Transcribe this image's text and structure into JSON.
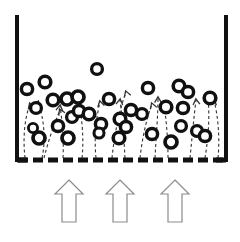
{
  "figure": {
    "kind": "fluidized-bed-schematic",
    "width": 240,
    "height": 242,
    "background_color": "#ffffff"
  },
  "colors": {
    "wall": "#111111",
    "particle_ring": "#111111",
    "particle_core": "#ffffff",
    "distributor": "#111111",
    "streamline": "#333333",
    "inlet_arrow_stroke": "#8b8b8b",
    "inlet_arrow_fill": "#ffffff"
  },
  "vessel": {
    "left_wall": {
      "x": 17,
      "y_top": 15,
      "y_bottom": 162,
      "thickness": 4
    },
    "right_wall": {
      "x": 226,
      "y_top": 15,
      "y_bottom": 162,
      "thickness": 4
    },
    "left_foot": {
      "x1": 17,
      "x2": 27,
      "y": 160
    },
    "right_foot": {
      "x1": 216,
      "x2": 226,
      "y": 160
    }
  },
  "distributor_plate": {
    "y": 160,
    "x_start": 18,
    "x_end": 226,
    "thickness": 5,
    "dash_length": 10,
    "gap_length": 5
  },
  "particles": [
    {
      "cx": 27,
      "cy": 89,
      "r": 5.6
    },
    {
      "cx": 45,
      "cy": 82,
      "r": 5.8
    },
    {
      "cx": 36,
      "cy": 108,
      "r": 5.4
    },
    {
      "cx": 33,
      "cy": 128,
      "r": 4.6
    },
    {
      "cx": 39,
      "cy": 138,
      "r": 6.0
    },
    {
      "cx": 53,
      "cy": 100,
      "r": 5.8
    },
    {
      "cx": 58,
      "cy": 126,
      "r": 5.6
    },
    {
      "cx": 67,
      "cy": 99,
      "r": 6.0
    },
    {
      "cx": 78,
      "cy": 97,
      "r": 6.0
    },
    {
      "cx": 72,
      "cy": 117,
      "r": 5.4
    },
    {
      "cx": 79,
      "cy": 111,
      "r": 5.6
    },
    {
      "cx": 68,
      "cy": 138,
      "r": 6.0
    },
    {
      "cx": 89,
      "cy": 114,
      "r": 5.8
    },
    {
      "cx": 97,
      "cy": 69,
      "r": 5.4
    },
    {
      "cx": 101,
      "cy": 124,
      "r": 5.6
    },
    {
      "cx": 99,
      "cy": 133,
      "r": 5.0
    },
    {
      "cx": 109,
      "cy": 99,
      "r": 5.6
    },
    {
      "cx": 120,
      "cy": 119,
      "r": 5.8
    },
    {
      "cx": 126,
      "cy": 127,
      "r": 5.6
    },
    {
      "cx": 119,
      "cy": 138,
      "r": 5.8
    },
    {
      "cx": 131,
      "cy": 110,
      "r": 5.6
    },
    {
      "cx": 142,
      "cy": 114,
      "r": 5.4
    },
    {
      "cx": 148,
      "cy": 88,
      "r": 5.6
    },
    {
      "cx": 152,
      "cy": 134,
      "r": 5.6
    },
    {
      "cx": 166,
      "cy": 107,
      "r": 5.8
    },
    {
      "cx": 171,
      "cy": 142,
      "r": 6.0
    },
    {
      "cx": 179,
      "cy": 86,
      "r": 5.8
    },
    {
      "cx": 188,
      "cy": 92,
      "r": 5.6
    },
    {
      "cx": 183,
      "cy": 108,
      "r": 5.6
    },
    {
      "cx": 181,
      "cy": 126,
      "r": 5.4
    },
    {
      "cx": 197,
      "cy": 131,
      "r": 5.4
    },
    {
      "cx": 205,
      "cy": 136,
      "r": 5.6
    },
    {
      "cx": 210,
      "cy": 98,
      "r": 5.8
    }
  ],
  "streamlines": [
    {
      "path": "M 25 158 C 23 140 24 120 30 104",
      "arrow": {
        "x": 30,
        "y": 104,
        "angle": -20
      }
    },
    {
      "path": "M 42 158 C 46 140 44 118 38 102",
      "arrow": {
        "x": 38,
        "y": 102,
        "angle": 20
      }
    },
    {
      "path": "M 44 158 C 48 142 54 124 60 110",
      "arrow": {
        "x": 60,
        "y": 110,
        "angle": -25
      }
    },
    {
      "path": "M 63 158 C 64 138 62 120 60 106",
      "arrow": {
        "x": 60,
        "y": 106,
        "angle": 8
      }
    },
    {
      "path": "M 82 158 C 84 140 82 122 80 106",
      "arrow": {
        "x": 80,
        "y": 106,
        "angle": 8
      }
    },
    {
      "path": "M 96 158 C 94 138 96 118 100 102",
      "arrow": {
        "x": 100,
        "y": 102,
        "angle": -14
      }
    },
    {
      "path": "M 112 158 C 114 138 118 114 126 92",
      "arrow": {
        "x": 126,
        "y": 92,
        "angle": -20
      }
    },
    {
      "path": "M 125 158 C 124 138 122 116 120 100",
      "arrow": {
        "x": 120,
        "y": 100,
        "angle": 8
      }
    },
    {
      "path": "M 140 158 C 142 140 146 120 152 104",
      "arrow": {
        "x": 152,
        "y": 104,
        "angle": -20
      }
    },
    {
      "path": "M 155 158 C 156 138 158 116 158 98",
      "arrow": {
        "x": 158,
        "y": 98,
        "angle": 0
      }
    },
    {
      "path": "M 168 158 C 168 138 166 118 164 104",
      "arrow": {
        "x": 164,
        "y": 104,
        "angle": 8
      }
    },
    {
      "path": "M 190 158 C 192 138 194 116 196 100",
      "arrow": {
        "x": 196,
        "y": 100,
        "angle": -6
      }
    },
    {
      "path": "M 205 158 C 208 140 210 118 208 98",
      "arrow": {
        "x": 208,
        "y": 98,
        "angle": 6
      }
    },
    {
      "path": "M 218 158 C 220 138 218 116 214 100",
      "arrow": {
        "x": 214,
        "y": 100,
        "angle": 12
      }
    }
  ],
  "inlet_arrows": [
    {
      "center_x": 69,
      "tip_y": 180,
      "base_y": 222,
      "shaft_half_width": 7,
      "head_half_width": 14,
      "head_height": 14
    },
    {
      "center_x": 120,
      "tip_y": 180,
      "base_y": 222,
      "shaft_half_width": 7,
      "head_half_width": 14,
      "head_height": 14
    },
    {
      "center_x": 175,
      "tip_y": 180,
      "base_y": 222,
      "shaft_half_width": 7,
      "head_half_width": 14,
      "head_height": 14
    }
  ]
}
